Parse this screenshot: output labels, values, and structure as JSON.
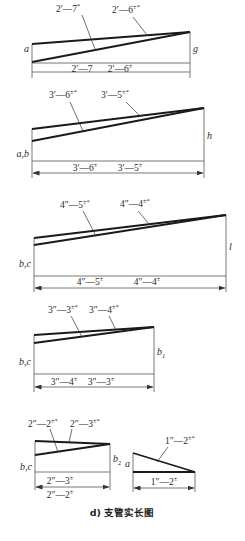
{
  "caption": "d) 支管实长图",
  "colors": {
    "line": "#1a1a1a",
    "thin": "#555555",
    "text": "#2a2a2a",
    "background": "#ffffff"
  },
  "diagrams": [
    {
      "id": "d1",
      "left_label": "a",
      "right_label": "g",
      "geometry": {
        "x0": 32,
        "x1": 190,
        "top_left": 44,
        "low_left": 62,
        "apex": 32,
        "base": 63,
        "dim": 72,
        "ext": 78
      },
      "leaders": [
        {
          "text": "2′—7",
          "sup": "*",
          "tx": 56,
          "ty": 12,
          "lx1": 82,
          "ly1": 15,
          "lx2": 95,
          "ly2": 49
        },
        {
          "text": "2′—6",
          "sup": "±*",
          "tx": 112,
          "ty": 13,
          "lx1": 133,
          "ly1": 17,
          "lx2": 147,
          "ly2": 35
        }
      ],
      "dim_labels": [
        {
          "text": "2′—7",
          "sup": "",
          "x": 82,
          "y": 72
        },
        {
          "text": "2′—6",
          "sup": "±",
          "x": 120,
          "y": 72
        }
      ],
      "arrows": false
    },
    {
      "id": "d2",
      "left_label": "a,b",
      "right_label": "h",
      "geometry": {
        "x0": 32,
        "x1": 204,
        "top_left": 129,
        "low_left": 141,
        "apex": 108,
        "base": 161,
        "dim": 173,
        "ext": 178
      },
      "leaders": [
        {
          "text": "3′—6",
          "sup": "±*",
          "tx": 49,
          "ty": 98,
          "lx1": 70,
          "ly1": 102,
          "lx2": 83,
          "ly2": 131
        },
        {
          "text": "3′—5",
          "sup": "±*",
          "tx": 101,
          "ty": 98,
          "lx1": 126,
          "ly1": 102,
          "lx2": 140,
          "ly2": 116
        }
      ],
      "dim_labels": [
        {
          "text": "3′—6",
          "sup": "±",
          "x": 85,
          "y": 171
        },
        {
          "text": "3′—5",
          "sup": "±",
          "x": 130,
          "y": 171
        }
      ],
      "arrows": true
    },
    {
      "id": "d3",
      "left_label": "b,c",
      "right_label": "l",
      "geometry": {
        "x0": 34,
        "x1": 226,
        "top_left": 238,
        "low_left": 245,
        "apex": 215,
        "base": 276,
        "dim": 288,
        "ext": 292
      },
      "leaders": [
        {
          "text": "4″—5",
          "sup": "±*",
          "tx": 60,
          "ty": 208,
          "lx1": 83,
          "ly1": 211,
          "lx2": 96,
          "ly2": 236
        },
        {
          "text": "4″—4",
          "sup": "±*",
          "tx": 120,
          "ty": 207,
          "lx1": 138,
          "ly1": 211,
          "lx2": 150,
          "ly2": 225
        }
      ],
      "dim_labels": [
        {
          "text": "4″—5",
          "sup": "±",
          "x": 90,
          "y": 285
        },
        {
          "text": "4″—4",
          "sup": "±",
          "x": 147,
          "y": 285
        }
      ],
      "arrows": true
    },
    {
      "id": "d4",
      "left_label": "b,c",
      "right_label": "b",
      "right_label_sub": "1",
      "geometry": {
        "x0": 34,
        "x1": 154,
        "top_left": 335,
        "low_left": 343,
        "apex": 327,
        "base": 374,
        "dim": 387,
        "ext": 392
      },
      "leaders": [
        {
          "text": "3″—3",
          "sup": "±*",
          "tx": 48,
          "ty": 313,
          "lx1": 71,
          "ly1": 316,
          "lx2": 82,
          "ly2": 337
        },
        {
          "text": "3″—4",
          "sup": "±*",
          "tx": 89,
          "ty": 313,
          "lx1": 109,
          "ly1": 316,
          "lx2": 116,
          "ly2": 330
        }
      ],
      "dim_labels": [
        {
          "text": "3″—4",
          "sup": "±",
          "x": 64,
          "y": 385
        },
        {
          "text": "3″—3",
          "sup": "±",
          "x": 101,
          "y": 385
        }
      ],
      "arrows": true
    },
    {
      "id": "d5",
      "left_label": "b,c",
      "right_label": "b",
      "right_label_sub": "2",
      "geometry": {
        "x0": 35,
        "x1": 110,
        "top_left": 441,
        "low_left": 455,
        "apex": 444,
        "base": 472,
        "dim": 487,
        "ext": 490
      },
      "leaders": [
        {
          "text": "2″—2",
          "sup": "±*",
          "tx": 28,
          "ty": 427,
          "lx1": 50,
          "ly1": 429,
          "lx2": 58,
          "ly2": 452
        },
        {
          "text": "2″—3",
          "sup": "±*",
          "tx": 70,
          "ty": 427,
          "lx1": 72,
          "ly1": 429,
          "lx2": 69,
          "ly2": 442
        }
      ],
      "dim_labels": [
        {
          "text": "2″—3",
          "sup": "±",
          "x": 60,
          "y": 484
        }
      ],
      "bottom_label": {
        "text": "2″—2",
        "sup": "±",
        "x": 60,
        "y": 498
      },
      "arrows": true
    },
    {
      "id": "d6",
      "left_label": "a",
      "geometry": {
        "x0": 133,
        "x1": 195,
        "top_left": 453,
        "base": 472,
        "dim": 488,
        "ext": 492
      },
      "leaders": [
        {
          "text": "1″—2",
          "sup": "±*",
          "tx": 165,
          "ty": 444,
          "lx1": 168,
          "ly1": 447,
          "lx2": 157,
          "ly2": 462
        }
      ],
      "dim_labels": [
        {
          "text": "1″—2",
          "sup": "±",
          "x": 164,
          "y": 485
        }
      ],
      "arrows": true
    }
  ]
}
